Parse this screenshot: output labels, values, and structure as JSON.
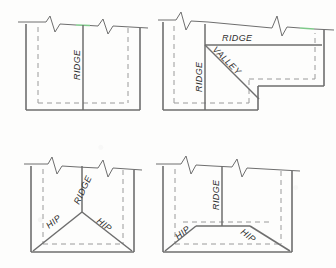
{
  "diagram": {
    "background_color": "#fdfdfc",
    "line_color": "#6e6e6e",
    "dash_color": "#9a9a9a",
    "accent_color": "#7fc98a",
    "text_color": "#2d2d2d",
    "panels": [
      {
        "id": "panel-top-left",
        "name": "gable-ridge-plan",
        "labels": [
          {
            "id": "ridge-vertical",
            "text": "RIDGE",
            "rotation": -90
          }
        ]
      },
      {
        "id": "panel-top-right",
        "name": "l-shape-valley-plan",
        "labels": [
          {
            "id": "ridge-horizontal",
            "text": "RIDGE",
            "rotation": 0
          },
          {
            "id": "ridge-vertical",
            "text": "RIDGE",
            "rotation": -90
          },
          {
            "id": "valley-diagonal",
            "text": "VALLEY",
            "rotation": 45
          }
        ]
      },
      {
        "id": "panel-bottom-left",
        "name": "hip-roof-plan-triangular",
        "labels": [
          {
            "id": "ridge-vertical",
            "text": "RIDGE",
            "rotation": -65
          },
          {
            "id": "hip-left",
            "text": "HIP",
            "rotation": -45
          },
          {
            "id": "hip-right",
            "text": "HIP",
            "rotation": 45
          }
        ]
      },
      {
        "id": "panel-bottom-right",
        "name": "hip-roof-plan-trapezoidal",
        "labels": [
          {
            "id": "ridge-vertical",
            "text": "RIDGE",
            "rotation": -90
          },
          {
            "id": "hip-left",
            "text": "HIP",
            "rotation": -38
          },
          {
            "id": "hip-right",
            "text": "HIP",
            "rotation": 38
          }
        ]
      }
    ]
  }
}
